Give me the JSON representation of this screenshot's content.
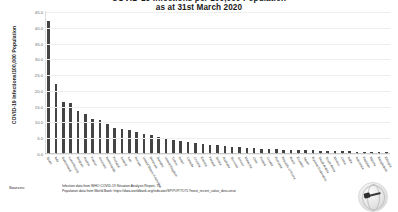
{
  "title": {
    "line1": "COVID-19 Infections per 100,000 Population",
    "line2": "as at 31st March 2020"
  },
  "axes": {
    "y_label": "COVID-19 Infections/100,000 Population",
    "y_ticks": [
      "45.0",
      "40.0",
      "35.0",
      "30.0",
      "25.0",
      "20.0",
      "15.0",
      "10.0",
      "5.0",
      "0.0"
    ]
  },
  "footer": {
    "sources_label": "Sources:",
    "source_line_1": "Infection data from WHO COVID-19 Situation Analysis Report, 71",
    "source_line_2": "Population data from World Bank: https://data.worldbank.org/indicator/SP.POP.TOTL?most_recent_value_desc=true"
  },
  "logo": {
    "name": "organisation-globe-logo"
  },
  "chart_data": {
    "type": "bar",
    "title": "COVID-19 Infections per 100,000 Population as at 31st March 2020",
    "xlabel": "",
    "ylabel": "COVID-19 Infections/100,000 Population",
    "ylim": [
      0,
      45
    ],
    "ytick_step": 5,
    "grid": true,
    "legend": false,
    "bar_color": "#444444",
    "categories": [
      "Spain",
      "Italy",
      "Switzerland",
      "Luxembourg",
      "Belgium",
      "Austria",
      "France",
      "Germany",
      "Netherlands",
      "Portugal",
      "Ireland",
      "Iran",
      "Norway",
      "United States of America",
      "Denmark",
      "Sweden",
      "United Kingdom",
      "Turkey",
      "Israel",
      "Canada",
      "Czechia",
      "Estonia",
      "Finland",
      "Serbia",
      "Australia",
      "Slovenia",
      "Greece",
      "Malaysia",
      "Chile",
      "Poland",
      "Croatia",
      "Romania",
      "Republic of Korea",
      "Brazil",
      "Ecuador",
      "Japan",
      "Russian Federation",
      "Saudi Arabia",
      "South Africa",
      "Mexico",
      "China",
      "India",
      "Indonesia",
      "Pakistan",
      "Nigeria",
      "Bangladesh",
      "Ethiopia"
    ],
    "values": [
      41.8,
      21.9,
      16.3,
      15.8,
      13.3,
      12.4,
      10.9,
      10.5,
      9.1,
      8.0,
      7.6,
      7.2,
      6.6,
      6.1,
      5.7,
      5.2,
      4.7,
      4.2,
      3.8,
      3.4,
      3.1,
      2.8,
      2.6,
      2.4,
      2.2,
      2.0,
      1.8,
      1.6,
      1.5,
      1.4,
      1.3,
      1.2,
      1.1,
      1.0,
      0.9,
      0.85,
      0.8,
      0.75,
      0.7,
      0.6,
      0.55,
      0.5,
      0.45,
      0.4,
      0.3,
      0.25,
      0.18
    ]
  }
}
